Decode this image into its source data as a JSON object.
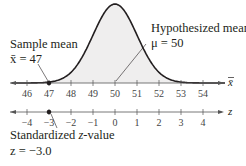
{
  "chart_data": {
    "type": "area",
    "title": "",
    "xbar_axis": {
      "label": "x̄",
      "ticks": [
        46,
        47,
        48,
        49,
        50,
        51,
        52,
        53,
        54
      ],
      "tick_labels": [
        "46",
        "47",
        "48",
        "49",
        "50",
        "51",
        "52",
        "53",
        "54"
      ]
    },
    "z_axis": {
      "label": "z",
      "ticks": [
        -4,
        -3,
        -2,
        -1,
        0,
        1,
        2,
        3,
        4
      ],
      "tick_labels": [
        "−4",
        "−3",
        "−2",
        "−1",
        "0",
        "1",
        "2",
        "3",
        "4"
      ]
    },
    "curve": {
      "distribution": "normal",
      "mean": 50,
      "std_error": 1
    },
    "points": [
      {
        "axis": "x̄",
        "value": 47
      },
      {
        "axis": "z",
        "value": -3
      }
    ],
    "annotations": [
      {
        "line1": "Sample mean",
        "line2": "x̄ = 47",
        "points_to": 47
      },
      {
        "line1": "Hypothesized mean",
        "line2": "μ = 50",
        "points_to": 50
      },
      {
        "line1": "Standardized z-value",
        "line2": "z = −3.0",
        "points_to": -3
      }
    ],
    "grid": false,
    "legend": null
  },
  "labels": {
    "sample_mean_title": "Sample mean",
    "sample_mean_value": "x̄ = 47",
    "hyp_mean_title": "Hypothesized mean",
    "hyp_mean_value": "μ = 50",
    "z_title_pre": "Standardized ",
    "z_title_var": "z",
    "z_title_post": "-value",
    "z_value": "z = −3.0",
    "xbar_axis_label": "x̄",
    "z_axis_label": "z"
  }
}
